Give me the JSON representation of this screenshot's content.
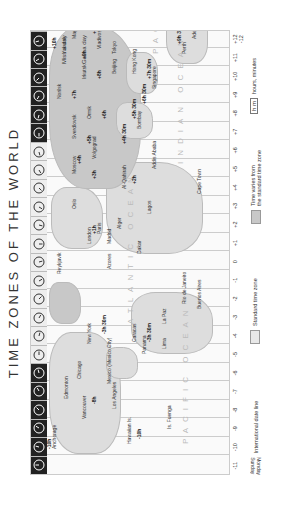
{
  "title": "TIME ZONES OF THE WORLD",
  "zone_offsets": [
    "-11",
    "-10",
    "-9",
    "-8",
    "-7",
    "-6",
    "-5",
    "-4",
    "-3",
    "-2",
    "-1",
    "0",
    "+1",
    "+2",
    "+3",
    "+4",
    "+5",
    "+6",
    "+7",
    "+8",
    "+9",
    "+10",
    "+11",
    "+12 -12"
  ],
  "clock_count": 24,
  "oceans": [
    {
      "name": "PACIFIC OCEAN",
      "x": 30,
      "y": 150
    },
    {
      "name": "ATLANTIC OCEAN",
      "x": 150,
      "y": 95
    },
    {
      "name": "INDIAN OCEAN",
      "x": 310,
      "y": 145
    },
    {
      "name": "PACIFIC",
      "x": 420,
      "y": 120
    }
  ],
  "cities": [
    {
      "name": "Anchorage",
      "x": 25,
      "y": 20
    },
    {
      "name": "Hawaiian Is.",
      "x": 30,
      "y": 95
    },
    {
      "name": "Vancouver",
      "x": 55,
      "y": 50
    },
    {
      "name": "Los Angeles",
      "x": 65,
      "y": 80
    },
    {
      "name": "Edmonton",
      "x": 75,
      "y": 32
    },
    {
      "name": "Chicago",
      "x": 95,
      "y": 45
    },
    {
      "name": "Mexico (Mexico City)",
      "x": 90,
      "y": 75
    },
    {
      "name": "New York",
      "x": 130,
      "y": 55
    },
    {
      "name": "Panama",
      "x": 120,
      "y": 110
    },
    {
      "name": "Caracas",
      "x": 132,
      "y": 100
    },
    {
      "name": "Lima",
      "x": 125,
      "y": 130
    },
    {
      "name": "La Paz",
      "x": 150,
      "y": 130
    },
    {
      "name": "Rio de Janeiro",
      "x": 170,
      "y": 150
    },
    {
      "name": "Buenos Aires",
      "x": 165,
      "y": 165
    },
    {
      "name": "Is. Fuenga",
      "x": 45,
      "y": 135
    },
    {
      "name": "Reykjavik",
      "x": 200,
      "y": 25
    },
    {
      "name": "Azores",
      "x": 205,
      "y": 75
    },
    {
      "name": "London",
      "x": 230,
      "y": 55
    },
    {
      "name": "Paris",
      "x": 240,
      "y": 65
    },
    {
      "name": "Madrid",
      "x": 230,
      "y": 75
    },
    {
      "name": "Alger",
      "x": 245,
      "y": 85
    },
    {
      "name": "Dakar",
      "x": 220,
      "y": 105
    },
    {
      "name": "Lagos",
      "x": 260,
      "y": 115
    },
    {
      "name": "Cape Town",
      "x": 280,
      "y": 165
    },
    {
      "name": "Oslo",
      "x": 265,
      "y": 40
    },
    {
      "name": "Moscow",
      "x": 300,
      "y": 40
    },
    {
      "name": "Al-Qahirah",
      "x": 285,
      "y": 90
    },
    {
      "name": "Addis Ababa",
      "x": 305,
      "y": 120
    },
    {
      "name": "Volgograd",
      "x": 315,
      "y": 60
    },
    {
      "name": "Sverdlovsk",
      "x": 335,
      "y": 40
    },
    {
      "name": "Omsk",
      "x": 355,
      "y": 55
    },
    {
      "name": "Bombay",
      "x": 345,
      "y": 105
    },
    {
      "name": "Norilsk",
      "x": 375,
      "y": 25
    },
    {
      "name": "Singapore",
      "x": 385,
      "y": 120
    },
    {
      "name": "Hong Kong",
      "x": 400,
      "y": 100
    },
    {
      "name": "Beijing",
      "x": 400,
      "y": 80
    },
    {
      "name": "Irkutsk",
      "x": 395,
      "y": 50
    },
    {
      "name": "Yakutsk",
      "x": 420,
      "y": 30
    },
    {
      "name": "Tokyo",
      "x": 420,
      "y": 80
    },
    {
      "name": "Perth",
      "x": 420,
      "y": 150
    },
    {
      "name": "Adelaide",
      "x": 435,
      "y": 160
    },
    {
      "name": "Magadan",
      "x": 435,
      "y": 40
    },
    {
      "name": "Vladivostok",
      "x": 425,
      "y": 65
    },
    {
      "name": "Caroline Is.",
      "x": 450,
      "y": 110
    },
    {
      "name": "Sydney",
      "x": 455,
      "y": 160
    },
    {
      "name": "Anadyr",
      "x": 465,
      "y": 20
    },
    {
      "name": "Petropavlovsk Kamch.",
      "x": 460,
      "y": 45
    },
    {
      "name": "Wellington",
      "x": 475,
      "y": 175
    },
    {
      "name": "Fiji",
      "x": 480,
      "y": 140
    }
  ],
  "offset_labels": [
    {
      "text": "-10h",
      "x": 25,
      "y": 15
    },
    {
      "text": "-10h",
      "x": 35,
      "y": 105
    },
    {
      "text": "-8h",
      "x": 70,
      "y": 60
    },
    {
      "text": "-3h 30m",
      "x": 140,
      "y": 70
    },
    {
      "text": "-3h 30m",
      "x": 132,
      "y": 115
    },
    {
      "text": "+1h",
      "x": 240,
      "y": 60
    },
    {
      "text": "+2h",
      "x": 290,
      "y": 100
    },
    {
      "text": "+3h",
      "x": 295,
      "y": 60
    },
    {
      "text": "+4h",
      "x": 310,
      "y": 45
    },
    {
      "text": "+5h",
      "x": 330,
      "y": 55
    },
    {
      "text": "+6h",
      "x": 355,
      "y": 70
    },
    {
      "text": "+4h 30m",
      "x": 330,
      "y": 90
    },
    {
      "text": "+5h 30m",
      "x": 355,
      "y": 100
    },
    {
      "text": "+6h 30m",
      "x": 370,
      "y": 110
    },
    {
      "text": "+7h",
      "x": 375,
      "y": 40
    },
    {
      "text": "+7h 30m",
      "x": 395,
      "y": 115
    },
    {
      "text": "+8h",
      "x": 395,
      "y": 65
    },
    {
      "text": "+9h",
      "x": 415,
      "y": 50
    },
    {
      "text": "+9h 30m",
      "x": 430,
      "y": 145
    },
    {
      "text": "+10h",
      "x": 425,
      "y": 20
    },
    {
      "text": "+11h",
      "x": 445,
      "y": 30
    },
    {
      "text": "+11h",
      "x": 440,
      "y": 60
    },
    {
      "text": "+12h",
      "x": 455,
      "y": 30
    },
    {
      "text": "+13h",
      "x": 470,
      "y": 10
    },
    {
      "text": "-11h",
      "x": 465,
      "y": 45
    }
  ],
  "date_line_notes": {
    "miss": "Miss a day",
    "gain": "Gain a day",
    "monday": "Monday",
    "sunday": "Sunday"
  },
  "legend": {
    "date_line": "International date line",
    "standard": "Standard time zone",
    "varies_1": "Time varies from",
    "varies_2": "the standard time zone",
    "hm_box": "h m",
    "hm_text": "hours, minutes",
    "date_sunday": "Sunday",
    "date_monday": "Monday"
  },
  "colors": {
    "land": "#dddddd",
    "varies": "#c8c8c8",
    "clock_dark": "#222222"
  }
}
